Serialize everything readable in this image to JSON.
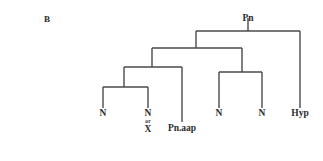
{
  "figure": {
    "panel_label": "B",
    "line_color": "#4a4a4a",
    "text_color": "#2b2b2b",
    "background_color": "#ffffff",
    "line_width": 1.4
  },
  "tree": {
    "root": {
      "label": "Pn",
      "x": 248,
      "label_y": 14,
      "stem_top": 18,
      "stem_bottom": 31
    },
    "connectors": [
      {
        "name": "root-bar",
        "y": 31,
        "x1": 196,
        "x2": 300
      },
      {
        "name": "level2-bar",
        "y": 48,
        "x1": 152,
        "x2": 242
      },
      {
        "name": "level3-left-bar",
        "y": 67,
        "x1": 124,
        "x2": 182
      },
      {
        "name": "level3-right-bar",
        "y": 72,
        "x1": 219,
        "x2": 262
      },
      {
        "name": "level4-left-bar",
        "y": 87,
        "x1": 103,
        "x2": 148
      }
    ],
    "internal_stems": [
      {
        "name": "level2-stem",
        "x": 196,
        "y1": 31,
        "y2": 48
      },
      {
        "name": "level3-left-stem",
        "x": 152,
        "y1": 48,
        "y2": 67
      },
      {
        "name": "level3-right-stem",
        "x": 242,
        "y1": 48,
        "y2": 72
      },
      {
        "name": "level4-left-stem",
        "x": 124,
        "y1": 67,
        "y2": 87
      }
    ],
    "leaves": [
      {
        "name": "leaf-n-1",
        "label": "N",
        "alt": null,
        "conjunction": null,
        "x": 103,
        "stem_top": 87,
        "stem_bottom": 108,
        "label_y": 109
      },
      {
        "name": "leaf-n-or-x",
        "label": "N",
        "alt": "X",
        "conjunction": "or",
        "x": 148,
        "stem_top": 87,
        "stem_bottom": 108,
        "label_y": 109
      },
      {
        "name": "leaf-pn-aap",
        "label": "Pn.aap",
        "alt": null,
        "conjunction": null,
        "x": 182,
        "stem_top": 67,
        "stem_bottom": 122,
        "label_y": 124
      },
      {
        "name": "leaf-n-2",
        "label": "N",
        "alt": null,
        "conjunction": null,
        "x": 219,
        "stem_top": 72,
        "stem_bottom": 108,
        "label_y": 109
      },
      {
        "name": "leaf-n-3",
        "label": "N",
        "alt": null,
        "conjunction": null,
        "x": 262,
        "stem_top": 72,
        "stem_bottom": 108,
        "label_y": 109
      },
      {
        "name": "leaf-hyp",
        "label": "Hyp",
        "alt": null,
        "conjunction": null,
        "x": 300,
        "stem_top": 31,
        "stem_bottom": 108,
        "label_y": 109
      }
    ]
  }
}
